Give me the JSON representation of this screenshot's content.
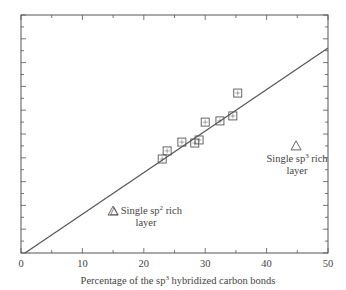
{
  "chart_data": {
    "type": "scatter",
    "title": "",
    "xlabel": "Percentage of the sp3 hybridized carbon bonds",
    "xlabel_parts": {
      "pre": "Percentage of the sp",
      "sup": "3",
      "post": " hybridized carbon bonds"
    },
    "ylabel": "",
    "xlim": [
      0,
      50
    ],
    "ylim": [
      0,
      100
    ],
    "y_units": "relative (no y tick labels visible)",
    "x_ticks": [
      0,
      10,
      20,
      30,
      40,
      50
    ],
    "x_tick_labels": [
      "0",
      "10",
      "20",
      "30",
      "40",
      "50"
    ],
    "grid": false,
    "legend": null,
    "series": [
      {
        "name": "Multilayer data",
        "marker": "square",
        "x": [
          23.0,
          23.8,
          26.2,
          28.3,
          29.0,
          30.0,
          32.4,
          34.5,
          35.3
        ],
        "y": [
          39.5,
          42.9,
          46.6,
          46.2,
          47.5,
          55.0,
          55.5,
          57.6,
          67.2
        ]
      },
      {
        "name": "Single layers",
        "marker": "triangle",
        "x": [
          15.0,
          44.8
        ],
        "y": [
          17.6,
          45.0
        ]
      },
      {
        "name": "Linear fit",
        "type": "line",
        "x": [
          0.65,
          50
        ],
        "y": [
          0,
          86.1
        ]
      }
    ],
    "annotations": [
      {
        "text": "Single sp2 rich layer",
        "line1_pre": "Single sp",
        "line1_sup": "2",
        "line1_post": " rich",
        "line2": "layer",
        "x": 15.0,
        "y": 17.6
      },
      {
        "text": "Single sp3 rich layer",
        "line1_pre": "Single sp",
        "line1_sup": "3",
        "line1_post": " rich",
        "line2": "layer",
        "x": 44.8,
        "y": 45.0
      }
    ]
  },
  "colors": {
    "axis": "#555555",
    "marker": "#555555",
    "line": "#555555",
    "text": "#444444"
  }
}
